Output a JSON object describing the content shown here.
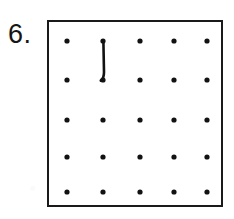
{
  "item": {
    "number_label": "6.",
    "kind": "geoboard-dot-grid"
  },
  "board": {
    "border_color": "#1a1a1a",
    "background_color": "#ffffff",
    "dot_color": "#121212",
    "line_color": "#121212",
    "rows": 5,
    "columns": 5,
    "dot_radius": 2.6,
    "frame": {
      "x": 47,
      "y": 20,
      "width": 176,
      "height": 187
    }
  },
  "chart_data": {
    "type": "scatter",
    "title": "",
    "xlabel": "",
    "ylabel": "",
    "xlim": [
      0,
      4
    ],
    "ylim": [
      0,
      4
    ],
    "grid": false,
    "legend": null,
    "dot_columns_px": [
      18,
      54,
      91,
      125,
      158
    ],
    "dot_rows_px": [
      19,
      58,
      98,
      135,
      170
    ],
    "points": [
      {
        "row": 0,
        "col": 0
      },
      {
        "row": 0,
        "col": 1
      },
      {
        "row": 0,
        "col": 2
      },
      {
        "row": 0,
        "col": 3
      },
      {
        "row": 0,
        "col": 4
      },
      {
        "row": 1,
        "col": 0
      },
      {
        "row": 1,
        "col": 1
      },
      {
        "row": 1,
        "col": 2
      },
      {
        "row": 1,
        "col": 3
      },
      {
        "row": 1,
        "col": 4
      },
      {
        "row": 2,
        "col": 0
      },
      {
        "row": 2,
        "col": 1
      },
      {
        "row": 2,
        "col": 2
      },
      {
        "row": 2,
        "col": 3
      },
      {
        "row": 2,
        "col": 4
      },
      {
        "row": 3,
        "col": 0
      },
      {
        "row": 3,
        "col": 1
      },
      {
        "row": 3,
        "col": 2
      },
      {
        "row": 3,
        "col": 3
      },
      {
        "row": 3,
        "col": 4
      },
      {
        "row": 4,
        "col": 0
      },
      {
        "row": 4,
        "col": 1
      },
      {
        "row": 4,
        "col": 2
      },
      {
        "row": 4,
        "col": 3
      },
      {
        "row": 4,
        "col": 4
      }
    ],
    "segments": [
      {
        "name": "vertical-segment",
        "from": {
          "row": 0,
          "col": 1
        },
        "to": {
          "row": 1,
          "col": 1
        },
        "path": "M 54.4 19.5 L 55.0 50.0 Q 55.1 56.0 51.8 58.6"
      }
    ]
  }
}
